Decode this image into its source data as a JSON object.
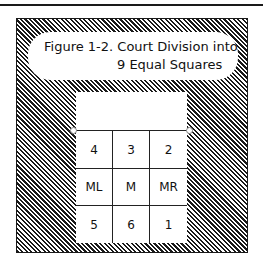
{
  "figure": {
    "caption_line1": "Figure 1-2. Court Division into",
    "caption_line2": "9 Equal Squares"
  },
  "court": {
    "zones": [
      [
        "4",
        "3",
        "2"
      ],
      [
        "ML",
        "M",
        "MR"
      ],
      [
        "5",
        "6",
        "1"
      ]
    ]
  }
}
